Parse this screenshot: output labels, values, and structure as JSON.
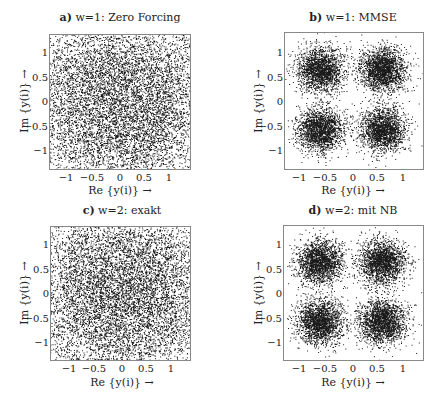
{
  "figure": {
    "background": "#ffffff",
    "point_color": "#1a1a1a",
    "axis_color": "#888888"
  },
  "chart_data": [
    {
      "type": "scatter",
      "id": "a",
      "title_prefix": "a)",
      "title": "w=1: Zero Forcing",
      "xlabel": "Re {y(i)} →",
      "ylabel": "Im {y(i)} →",
      "xlim": [
        -1.35,
        1.35
      ],
      "ylim": [
        -1.4,
        1.35
      ],
      "xticks": [
        -1,
        -0.5,
        0,
        0.5,
        1
      ],
      "xtick_labels": [
        "−1",
        "−0.5",
        "0",
        "0.5",
        "1"
      ],
      "yticks": [
        1,
        0.5,
        0,
        -0.5,
        -1
      ],
      "ytick_labels": [
        "1",
        "0.5",
        "0",
        "−0.5",
        "−1"
      ],
      "grid": false,
      "description": "Received QPSK symbols after zero-forcing equalization; points spread almost uniformly over the whole plot area, no distinct clusters",
      "cluster_centers": [
        [
          -0.6,
          0.6
        ],
        [
          0.6,
          0.6
        ],
        [
          -0.6,
          -0.6
        ],
        [
          0.6,
          -0.6
        ]
      ],
      "cluster_std": 0.65,
      "n_points": 9000,
      "seed": 11
    },
    {
      "type": "scatter",
      "id": "b",
      "title_prefix": "b)",
      "title": "w=1: MMSE",
      "xlabel": "Re {y(i)} →",
      "ylabel": "Im {y(i)} →",
      "xlim": [
        -1.3,
        1.4
      ],
      "ylim": [
        -1.4,
        1.35
      ],
      "xticks": [
        -1,
        -0.5,
        0,
        0.5,
        1
      ],
      "xtick_labels": [
        "−1",
        "−0.5",
        "0",
        "0.5",
        "1"
      ],
      "yticks": [
        1,
        0.5,
        0,
        -0.5,
        -1
      ],
      "ytick_labels": [
        "1",
        "0.5",
        "0",
        "−0.5",
        "−1"
      ],
      "grid": false,
      "description": "Received QPSK symbols after MMSE equalization; four dense clusters centered near (±0.6, ±0.6)",
      "cluster_centers": [
        [
          -0.6,
          0.6
        ],
        [
          0.6,
          0.6
        ],
        [
          -0.6,
          -0.6
        ],
        [
          0.6,
          -0.6
        ]
      ],
      "cluster_std": 0.22,
      "n_points": 8000,
      "seed": 23
    },
    {
      "type": "scatter",
      "id": "c",
      "title_prefix": "c)",
      "title": "w=2: exakt",
      "xlabel": "Re {y(i)} →",
      "ylabel": "Im {y(i)} →",
      "xlim": [
        -1.4,
        1.35
      ],
      "ylim": [
        -1.4,
        1.35
      ],
      "xticks": [
        -1,
        -0.5,
        0,
        0.5,
        1
      ],
      "xtick_labels": [
        "−1",
        "−0.5",
        "0",
        "0.5",
        "1"
      ],
      "yticks": [
        1,
        0.5,
        0,
        -0.5,
        -1
      ],
      "ytick_labels": [
        "1",
        "0.5",
        "0",
        "−0.5",
        "−1"
      ],
      "grid": false,
      "description": "Exact solution for w=2; points spread nearly uniformly across the whole area, no distinct clusters",
      "cluster_centers": [
        [
          -0.6,
          0.6
        ],
        [
          0.6,
          0.6
        ],
        [
          -0.6,
          -0.6
        ],
        [
          0.6,
          -0.6
        ]
      ],
      "cluster_std": 0.65,
      "n_points": 9000,
      "seed": 37
    },
    {
      "type": "scatter",
      "id": "d",
      "title_prefix": "d)",
      "title": "w=2: mit NB",
      "xlabel": "Re {y(i)} →",
      "ylabel": "Im {y(i)} →",
      "xlim": [
        -1.3,
        1.4
      ],
      "ylim": [
        -1.4,
        1.35
      ],
      "xticks": [
        -1,
        -0.5,
        0,
        0.5,
        1
      ],
      "xtick_labels": [
        "−1",
        "−0.5",
        "0",
        "0.5",
        "1"
      ],
      "yticks": [
        1,
        0.5,
        0,
        -0.5,
        -1
      ],
      "ytick_labels": [
        "1",
        "0.5",
        "0",
        "−0.5",
        "−1"
      ],
      "grid": false,
      "description": "w=2 with constraint (NB); four dense clusters centered near (±0.6, ±0.6)",
      "cluster_centers": [
        [
          -0.6,
          0.6
        ],
        [
          0.6,
          0.6
        ],
        [
          -0.6,
          -0.6
        ],
        [
          0.6,
          -0.6
        ]
      ],
      "cluster_std": 0.22,
      "n_points": 8000,
      "seed": 51
    }
  ]
}
